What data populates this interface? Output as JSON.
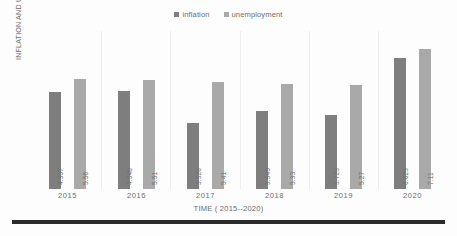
{
  "chart_data": {
    "type": "bar",
    "title": "",
    "subtitle": "",
    "xlabel": "TIME ( 2015--2020)",
    "ylabel": "INFLATION AND UNEMPLOYMENT (%)",
    "categories": [
      "2015",
      "2016",
      "2017",
      "2018",
      "2019",
      "2020"
    ],
    "series": [
      {
        "name": "inflation",
        "color": "#7e7e7e",
        "values": [
          4.907,
          4.948,
          3.328,
          3.945,
          3.723,
          6.623
        ],
        "labels": [
          "4.907",
          "4.948",
          "3.328",
          "3.945",
          "3.723",
          "6.623"
        ]
      },
      {
        "name": "unemployment",
        "color": "#a9a9a9",
        "values": [
          5.56,
          5.51,
          5.41,
          5.33,
          5.27,
          7.11
        ],
        "labels": [
          "5.56",
          "5.51",
          "5.41",
          "5.33",
          "5.27",
          "7.11"
        ]
      }
    ],
    "ylim": [
      0,
      8
    ],
    "grid": "vertical-category-separators",
    "axis_tick_labels_visible": false,
    "legend_position": "top-center",
    "data_labels": true,
    "data_label_rotation": 90
  },
  "legend": {
    "items": [
      {
        "label": "inflation",
        "color": "#7e7e7e"
      },
      {
        "label": "unemployment",
        "color": "#a9a9a9"
      }
    ]
  },
  "axes": {
    "y_title": "INFLATION AND UNEMPLOYMENT (%)",
    "x_title": "TIME ( 2015--2020)",
    "x_ticks": [
      "2015",
      "2016",
      "2017",
      "2018",
      "2019",
      "2020"
    ]
  },
  "groups": [
    {
      "category": "2015",
      "bars": [
        {
          "series": "inflation",
          "value": 4.907,
          "label": "4.907"
        },
        {
          "series": "unemployment",
          "value": 5.56,
          "label": "5.56"
        }
      ]
    },
    {
      "category": "2016",
      "bars": [
        {
          "series": "inflation",
          "value": 4.948,
          "label": "4.948"
        },
        {
          "series": "unemployment",
          "value": 5.51,
          "label": "5.51"
        }
      ]
    },
    {
      "category": "2017",
      "bars": [
        {
          "series": "inflation",
          "value": 3.328,
          "label": "3.328"
        },
        {
          "series": "unemployment",
          "value": 5.41,
          "label": "5.41"
        }
      ]
    },
    {
      "category": "2018",
      "bars": [
        {
          "series": "inflation",
          "value": 3.945,
          "label": "3.945"
        },
        {
          "series": "unemployment",
          "value": 5.33,
          "label": "5.33"
        }
      ]
    },
    {
      "category": "2019",
      "bars": [
        {
          "series": "inflation",
          "value": 3.723,
          "label": "3.723"
        },
        {
          "series": "unemployment",
          "value": 5.27,
          "label": "5.27"
        }
      ]
    },
    {
      "category": "2020",
      "bars": [
        {
          "series": "inflation",
          "value": 6.623,
          "label": "6.623"
        },
        {
          "series": "unemployment",
          "value": 7.11,
          "label": "7.11"
        }
      ]
    }
  ],
  "style": {
    "max_value": 8,
    "plot_height_px": 158,
    "inflation_color": "#7e7e7e",
    "unemployment_color": "#a9a9a9",
    "text_color": "#6d6d6d",
    "rule_color": "#2b2b2b"
  }
}
